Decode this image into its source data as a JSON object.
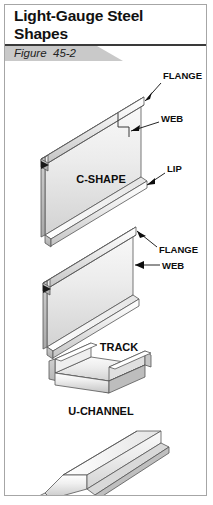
{
  "figure": {
    "title": "Light-Gauge Steel Shapes",
    "number_label": "Figure  45-2"
  },
  "shapes": [
    {
      "name": "C-SHAPE",
      "callouts": [
        {
          "label": "FLANGE"
        },
        {
          "label": "WEB"
        },
        {
          "label": "LIP"
        }
      ]
    },
    {
      "name": "TRACK",
      "callouts": [
        {
          "label": "FLANGE"
        },
        {
          "label": "WEB"
        }
      ]
    },
    {
      "name": "U-CHANNEL",
      "callouts": []
    },
    {
      "name": "FURRING CHANNEL",
      "callouts": []
    }
  ],
  "colors": {
    "border": "#a6a6a6",
    "header_rule": "#3a3a3a",
    "band": "#c9c9c9",
    "metal_light": "#f4f4f4",
    "metal_mid": "#dcdcdc",
    "metal_dark": "#b4b4b4",
    "outline": "#555555",
    "text": "#0d0d0d"
  }
}
